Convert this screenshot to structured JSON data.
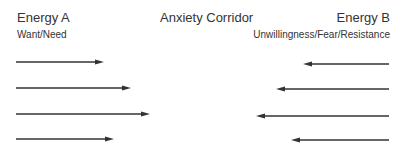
{
  "diagram": {
    "left": {
      "title": "Energy A",
      "subtitle": "Want/Need"
    },
    "center": {
      "title": "Anxiety Corridor"
    },
    "right": {
      "title": "Energy B",
      "subtitle": "Unwillingness/Fear/Resistance"
    },
    "arrow_color": "#333333",
    "left_arrows": [
      {
        "y": 62,
        "x1": 16,
        "x2": 104
      },
      {
        "y": 88,
        "x1": 16,
        "x2": 131
      },
      {
        "y": 114,
        "x1": 16,
        "x2": 150
      },
      {
        "y": 139,
        "x1": 16,
        "x2": 114
      }
    ],
    "right_arrows": [
      {
        "y": 64,
        "x1": 389,
        "x2": 303
      },
      {
        "y": 89,
        "x1": 389,
        "x2": 276
      },
      {
        "y": 116,
        "x1": 389,
        "x2": 256
      },
      {
        "y": 140,
        "x1": 389,
        "x2": 291
      }
    ]
  }
}
